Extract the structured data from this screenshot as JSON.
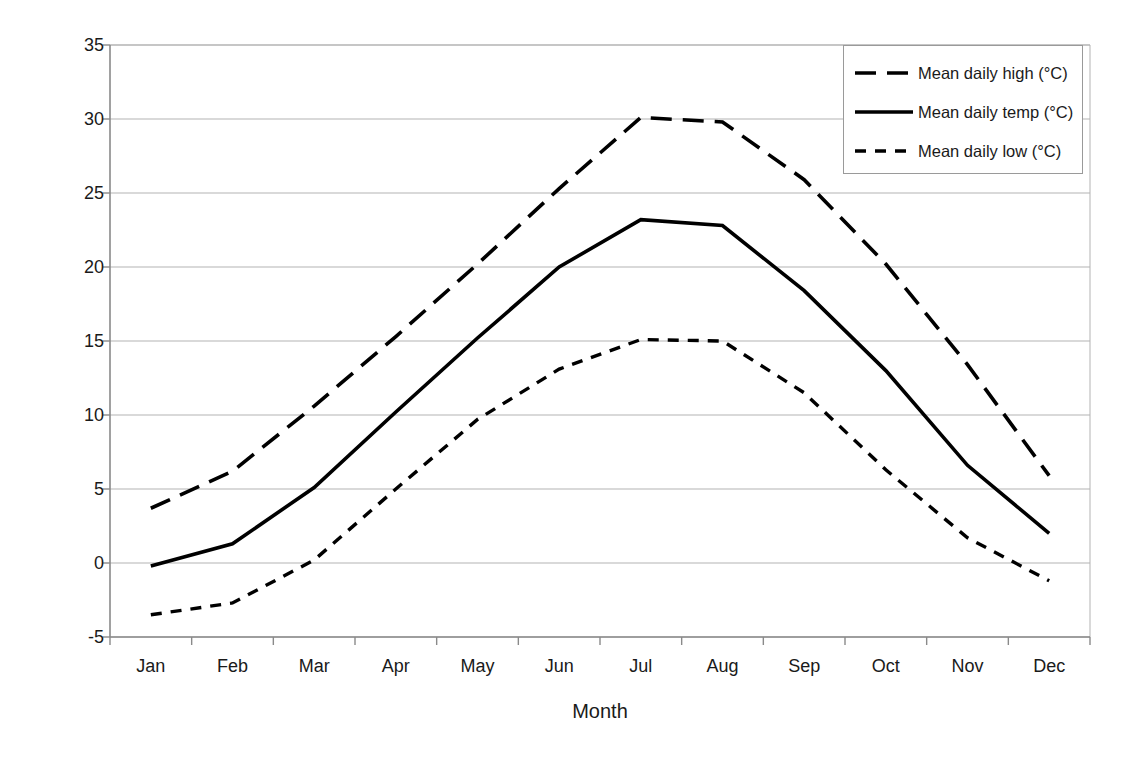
{
  "chart_data": {
    "type": "line",
    "title": "",
    "xlabel": "Month",
    "ylabel": "Temperature (degrees C)",
    "categories": [
      "Jan",
      "Feb",
      "Mar",
      "Apr",
      "May",
      "Jun",
      "Jul",
      "Aug",
      "Sep",
      "Oct",
      "Nov",
      "Dec"
    ],
    "ylim": [
      -5,
      35
    ],
    "yticks": [
      -5,
      0,
      5,
      10,
      15,
      20,
      25,
      30,
      35
    ],
    "grid": "horizontal",
    "legend_position": "top-right",
    "series": [
      {
        "name": "Mean daily high (°C)",
        "style": "long-dash",
        "color": "#000000",
        "values": [
          3.7,
          6.2,
          10.6,
          15.3,
          20.2,
          25.3,
          30.1,
          29.8,
          25.9,
          20.2,
          13.4,
          5.9
        ]
      },
      {
        "name": "Mean daily temp (°C)",
        "style": "solid",
        "color": "#000000",
        "values": [
          -0.2,
          1.3,
          5.1,
          10.2,
          15.2,
          20.0,
          23.2,
          22.8,
          18.4,
          13.0,
          6.6,
          2.0
        ]
      },
      {
        "name": "Mean daily low (°C)",
        "style": "short-dash",
        "color": "#000000",
        "values": [
          -3.5,
          -2.7,
          0.2,
          5.0,
          9.7,
          13.1,
          15.1,
          15.0,
          11.5,
          6.3,
          1.7,
          -1.2
        ]
      }
    ]
  },
  "axis": {
    "y_title": "Temperature (degrees C)",
    "x_title": "Month",
    "y_tick_labels": [
      "35",
      "30",
      "25",
      "20",
      "15",
      "10",
      "5",
      "0",
      "-5"
    ],
    "x_tick_labels": [
      "Jan",
      "Feb",
      "Mar",
      "Apr",
      "May",
      "Jun",
      "Jul",
      "Aug",
      "Sep",
      "Oct",
      "Nov",
      "Dec"
    ]
  },
  "legend": {
    "items": [
      {
        "label": "Mean daily high (°C)",
        "style": "long-dash"
      },
      {
        "label": "Mean daily temp (°C)",
        "style": "solid"
      },
      {
        "label": "Mean daily low (°C)",
        "style": "short-dash"
      }
    ]
  },
  "colors": {
    "line": "#000000",
    "grid": "#b3b3b3",
    "axis": "#8a8a8a",
    "background": "#ffffff"
  }
}
